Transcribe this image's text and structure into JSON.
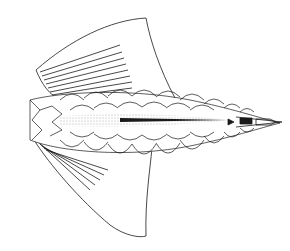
{
  "figure": {
    "background": "#ffffff",
    "ink": "#1a1a1a",
    "stipple": "#555555",
    "parts": [
      "upper-fin-lobe",
      "lower-fin-lobe",
      "fin-rays",
      "scale-rows",
      "lateral-line",
      "tail-tip"
    ]
  }
}
